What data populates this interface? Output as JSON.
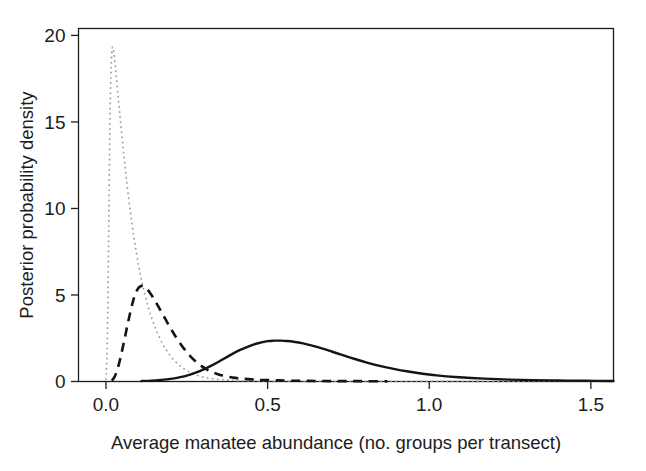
{
  "chart_data": {
    "type": "line",
    "title": "",
    "xlabel": "Average manatee abundance (no. groups per transect)",
    "ylabel": "Posterior probability density",
    "xlim": [
      -0.085,
      1.57
    ],
    "ylim": [
      0,
      20.4
    ],
    "xticks": [
      0.0,
      0.5,
      1.0,
      1.5
    ],
    "xticklabels": [
      "0.0",
      "0.5",
      "1.0",
      "1.5"
    ],
    "yticks": [
      0,
      5,
      10,
      15,
      20
    ],
    "yticklabels": [
      "0",
      "5",
      "10",
      "15",
      "20"
    ],
    "grid": false,
    "legend": "none",
    "frame": "box",
    "series": [
      {
        "name": "dotted-prior",
        "linestyle": "dotted",
        "color": "#9a9a9a",
        "linewidth": 1.6,
        "peak_x": 0.022,
        "peak_y": 19.3,
        "x": [
          0.0,
          0.004,
          0.008,
          0.012,
          0.016,
          0.02,
          0.024,
          0.028,
          0.032,
          0.038,
          0.044,
          0.05,
          0.056,
          0.062,
          0.07,
          0.078,
          0.086,
          0.094,
          0.102,
          0.11,
          0.12,
          0.13,
          0.14,
          0.15,
          0.162,
          0.174,
          0.186,
          0.198,
          0.212,
          0.226,
          0.24,
          0.256,
          0.272,
          0.29,
          0.31,
          0.33,
          0.355,
          0.38,
          0.41,
          0.44,
          0.48,
          0.52,
          0.57,
          0.62,
          0.68,
          0.74,
          0.82,
          0.9,
          1.0,
          1.15,
          1.35,
          1.57
        ],
        "y": [
          0.1,
          2.2,
          8.0,
          14.6,
          18.2,
          19.3,
          19.05,
          18.4,
          17.6,
          16.4,
          15.2,
          14.05,
          12.95,
          11.9,
          10.6,
          9.45,
          8.4,
          7.45,
          6.6,
          5.85,
          5.05,
          4.35,
          3.75,
          3.22,
          2.68,
          2.22,
          1.84,
          1.52,
          1.2,
          0.95,
          0.75,
          0.57,
          0.43,
          0.31,
          0.22,
          0.16,
          0.11,
          0.08,
          0.05,
          0.035,
          0.022,
          0.015,
          0.01,
          0.007,
          0.004,
          0.003,
          0.002,
          0.001,
          0.001,
          0.0,
          0.0,
          0.0
        ]
      },
      {
        "name": "dashed-posterior",
        "linestyle": "dashed",
        "color": "#141414",
        "linewidth": 2.6,
        "peak_x": 0.112,
        "peak_y": 5.52,
        "x": [
          0.018,
          0.026,
          0.034,
          0.042,
          0.05,
          0.058,
          0.066,
          0.074,
          0.082,
          0.09,
          0.098,
          0.106,
          0.114,
          0.122,
          0.13,
          0.14,
          0.15,
          0.16,
          0.172,
          0.184,
          0.196,
          0.208,
          0.22,
          0.234,
          0.248,
          0.262,
          0.276,
          0.292,
          0.308,
          0.324,
          0.342,
          0.36,
          0.38,
          0.4,
          0.42,
          0.45,
          0.48,
          0.52,
          0.56,
          0.61,
          0.66,
          0.72,
          0.79,
          0.87
        ],
        "y": [
          0.05,
          0.25,
          0.62,
          1.15,
          1.8,
          2.5,
          3.22,
          3.9,
          4.52,
          5.02,
          5.34,
          5.5,
          5.52,
          5.44,
          5.28,
          5.02,
          4.72,
          4.4,
          4.0,
          3.6,
          3.2,
          2.82,
          2.46,
          2.08,
          1.74,
          1.44,
          1.18,
          0.94,
          0.74,
          0.58,
          0.45,
          0.35,
          0.27,
          0.21,
          0.17,
          0.12,
          0.09,
          0.07,
          0.05,
          0.04,
          0.03,
          0.02,
          0.02,
          0.01
        ]
      },
      {
        "name": "solid-posterior",
        "linestyle": "solid",
        "color": "#141414",
        "linewidth": 2.4,
        "peak_x": 0.535,
        "peak_y": 2.36,
        "x": [
          0.11,
          0.14,
          0.17,
          0.2,
          0.23,
          0.26,
          0.29,
          0.32,
          0.35,
          0.38,
          0.41,
          0.44,
          0.47,
          0.5,
          0.52,
          0.54,
          0.56,
          0.58,
          0.61,
          0.64,
          0.67,
          0.7,
          0.73,
          0.77,
          0.81,
          0.85,
          0.89,
          0.93,
          0.98,
          1.03,
          1.08,
          1.13,
          1.19,
          1.25,
          1.32,
          1.4,
          1.48,
          1.57
        ],
        "y": [
          0.03,
          0.05,
          0.09,
          0.15,
          0.25,
          0.4,
          0.6,
          0.86,
          1.16,
          1.48,
          1.78,
          2.02,
          2.21,
          2.33,
          2.36,
          2.36,
          2.34,
          2.3,
          2.2,
          2.06,
          1.9,
          1.72,
          1.54,
          1.3,
          1.08,
          0.89,
          0.73,
          0.59,
          0.45,
          0.34,
          0.26,
          0.2,
          0.15,
          0.11,
          0.08,
          0.06,
          0.04,
          0.03
        ]
      }
    ]
  },
  "figure": {
    "background_color": "#ffffff",
    "axis_color": "#1c1c1c"
  }
}
